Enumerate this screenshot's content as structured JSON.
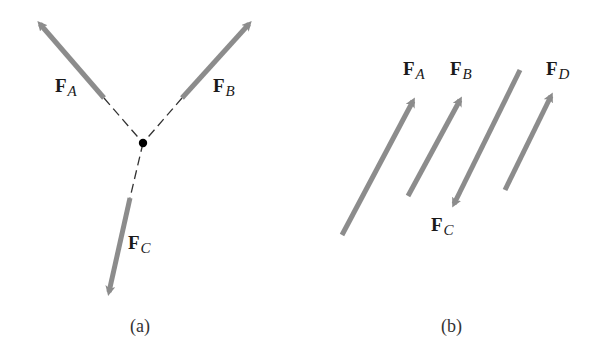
{
  "figure": {
    "colors": {
      "arrow": "#8c8c8c",
      "dash": "#333333",
      "dot": "#000000",
      "text": "#1a1a1a"
    },
    "panel_a": {
      "caption": "(a)",
      "description": "Three concurrent forces whose lines of action meet at a single point",
      "forces": [
        {
          "id": "FA",
          "symbol": "F",
          "subscript": "A"
        },
        {
          "id": "FB",
          "symbol": "F",
          "subscript": "B"
        },
        {
          "id": "FC",
          "symbol": "F",
          "subscript": "C"
        }
      ]
    },
    "panel_b": {
      "caption": "(b)",
      "description": "Four parallel forces",
      "forces": [
        {
          "id": "FA",
          "symbol": "F",
          "subscript": "A"
        },
        {
          "id": "FB",
          "symbol": "F",
          "subscript": "B"
        },
        {
          "id": "FC",
          "symbol": "F",
          "subscript": "C"
        },
        {
          "id": "FD",
          "symbol": "F",
          "subscript": "D"
        }
      ]
    }
  }
}
